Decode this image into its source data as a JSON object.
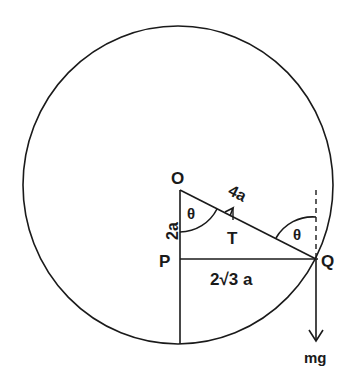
{
  "diagram": {
    "type": "physics-circle-pendulum",
    "stroke_color": "#1a1a1a",
    "points": {
      "O": "O",
      "P": "P",
      "Q": "Q"
    },
    "labels": {
      "OQ_length": "4a",
      "OP_length": "2a",
      "PQ_length": "2√3 a",
      "tension": "T",
      "angle_at_O": "θ",
      "angle_at_Q": "θ",
      "weight": "mg"
    }
  }
}
